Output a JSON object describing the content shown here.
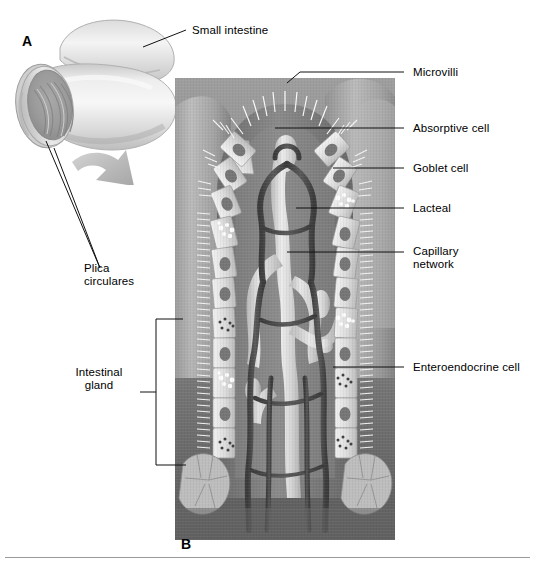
{
  "figure": {
    "panels": [
      {
        "id": "A",
        "name": "gross-small-intestine-panel"
      },
      {
        "id": "B",
        "name": "villus-histology-panel"
      }
    ],
    "signature_alt": "artist-signature"
  },
  "labels": {
    "small_intestine": "Small intestine",
    "plica_circulares": "Plica\ncirculares",
    "intestinal_gland": "Intestinal\ngland",
    "microvilli": "Microvilli",
    "absorptive_cell": "Absorptive cell",
    "goblet_cell": "Goblet cell",
    "lacteal": "Lacteal",
    "capillary_network": "Capillary\nnetwork",
    "enteroendocrine_cell": "Enteroendocrine cell"
  },
  "panel_ids": {
    "a": "A",
    "b": "B"
  },
  "colors": {
    "line": "#111111",
    "text": "#000000",
    "background": "#ffffff",
    "tissue_mid": "#8d8d8d",
    "tissue_dark": "#5d5d5d",
    "lacteal": "#d8d8d8",
    "capillary": "#4a4a4a",
    "epithelium": "#e6e6e6",
    "nucleus": "#6e6e6e",
    "goblet": "#fdfdfd"
  }
}
